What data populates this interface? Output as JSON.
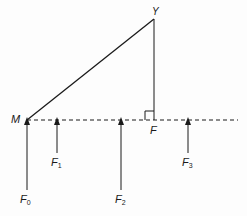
{
  "diagram": {
    "type": "force-geometry",
    "colors": {
      "stroke": "#1a1a1a",
      "background": "#fdfdfd"
    },
    "points": {
      "M": {
        "label": "M",
        "x": 27,
        "y": 120
      },
      "Y": {
        "label": "Y",
        "x": 154,
        "y": 19
      },
      "F": {
        "label": "F",
        "x": 154,
        "y": 120
      }
    },
    "segments": [
      {
        "from": "M",
        "to": "Y",
        "style": "solid"
      },
      {
        "from": "Y",
        "to": "F",
        "style": "solid",
        "note": "perpendicular"
      },
      {
        "from": "M",
        "to": "end",
        "style": "dashed",
        "note": "horizontal baseline"
      }
    ],
    "right_angle_at": "F",
    "forces": [
      {
        "name": "F0",
        "base": "F",
        "sub": "0",
        "x": 27,
        "y_tail": 190,
        "y_head": 120
      },
      {
        "name": "F1",
        "base": "F",
        "sub": "1",
        "x": 57,
        "y_tail": 153,
        "y_head": 120
      },
      {
        "name": "F2",
        "base": "F",
        "sub": "2",
        "x": 121,
        "y_tail": 190,
        "y_head": 120
      },
      {
        "name": "F3",
        "base": "F",
        "sub": "3",
        "x": 188,
        "y_tail": 153,
        "y_head": 120
      }
    ]
  }
}
